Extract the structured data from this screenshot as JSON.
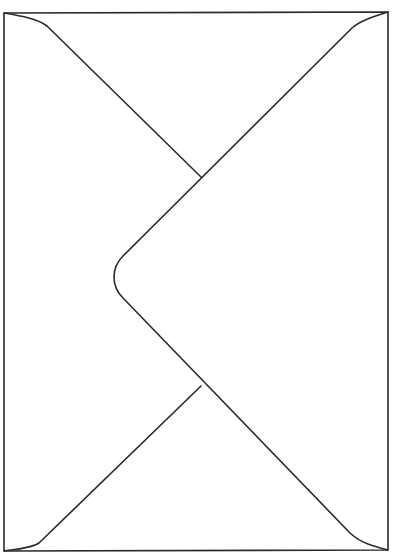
{
  "drawing": {
    "subject": "envelope-outline",
    "stroke_color": "#2a2a2a",
    "background": "#ffffff",
    "stroke_width": 1.6,
    "paths": {
      "outer_border": "M4 13 L388 12 L388 550 L4 551 Z",
      "top_left_fold": "M4 13 C 22 16, 38 19, 47 26 L 201 177",
      "flap": "M388 12 C 372 17, 360 21, 352 28 L 123 256 C 111 268, 111 286, 123 298 L 350 533 C 362 544, 376 547, 388 550",
      "bottom_left_fold": "M4 551 C 18 549, 32 548, 39 543 L 201 386"
    }
  }
}
